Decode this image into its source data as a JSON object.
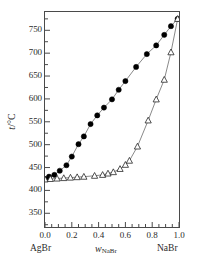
{
  "chart_data": {
    "type": "line",
    "title": "",
    "subtitle": "",
    "xlabel": "w_NaBr",
    "xlabel_symbol": "w",
    "xlabel_subscript": "NaBr",
    "ylabel": "t/°C",
    "ylabel_symbol": "t",
    "ylabel_unit": "/°C",
    "xlim": [
      0.0,
      1.0
    ],
    "ylim": [
      320,
      790
    ],
    "xticks": [
      "0.0",
      "0.2",
      "0.4",
      "0.6",
      "0.8",
      "1.0"
    ],
    "xtick_values": [
      0.0,
      0.2,
      0.4,
      0.6,
      0.8,
      1.0
    ],
    "yticks": [
      "350",
      "400",
      "450",
      "500",
      "550",
      "600",
      "650",
      "700",
      "750"
    ],
    "ytick_values": [
      350,
      400,
      450,
      500,
      550,
      600,
      650,
      700,
      750
    ],
    "y_minor_step": 25,
    "x_minor_step": 0.05,
    "grid": false,
    "legend": "none",
    "axis_endpoint_left": "AgBr",
    "axis_endpoint_right": "NaBr",
    "series": [
      {
        "name": "liquidus",
        "marker": "filled-circle",
        "marker_color": "#000000",
        "line_color": "#6b6b6b",
        "x": [
          0.0,
          0.03,
          0.07,
          0.11,
          0.16,
          0.2,
          0.25,
          0.29,
          0.34,
          0.39,
          0.44,
          0.5,
          0.55,
          0.6,
          0.68,
          0.76,
          0.83,
          0.89,
          0.94,
          0.99
        ],
        "y": [
          425,
          430,
          434,
          443,
          455,
          474,
          501,
          518,
          545,
          564,
          581,
          599,
          620,
          639,
          670,
          698,
          717,
          740,
          759,
          775
        ]
      },
      {
        "name": "solidus",
        "marker": "open-triangle",
        "marker_color": "#ffffff",
        "line_color": "#6b6b6b",
        "x": [
          0.0,
          0.04,
          0.09,
          0.14,
          0.19,
          0.24,
          0.29,
          0.37,
          0.43,
          0.47,
          0.51,
          0.56,
          0.6,
          0.63,
          0.69,
          0.77,
          0.83,
          0.89,
          0.94,
          0.99
        ],
        "y": [
          424,
          425,
          426,
          427,
          428,
          429,
          430,
          432,
          434,
          437,
          440,
          447,
          456,
          465,
          496,
          553,
          599,
          642,
          702,
          775
        ]
      }
    ],
    "annotations": []
  }
}
